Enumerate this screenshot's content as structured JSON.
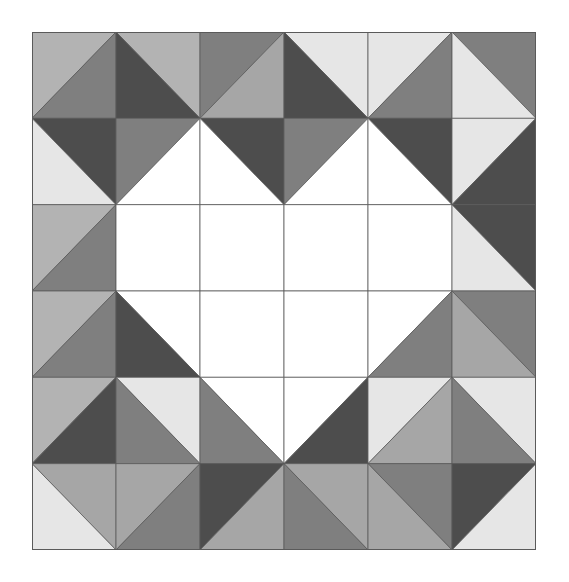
{
  "title": "Heart quilt block pattern",
  "grid": {
    "rows": 6,
    "cols": 6,
    "cell_w": 84,
    "cell_h": 86.33
  },
  "palette": {
    "W": "#ffffff",
    "VL": "#e6e6e6",
    "L": "#b3b3b3",
    "LM": "#a6a6a6",
    "M": "#7f7f7f",
    "D": "#4d4d4d",
    "line": "#5a5a5a"
  },
  "cells": [
    [
      {
        "diag": "/",
        "a": "L",
        "b": "M"
      },
      {
        "diag": "\\",
        "a": "L",
        "b": "D"
      },
      {
        "diag": "/",
        "a": "M",
        "b": "LM"
      },
      {
        "diag": "\\",
        "a": "VL",
        "b": "D"
      },
      {
        "diag": "/",
        "a": "VL",
        "b": "M"
      },
      {
        "diag": "\\",
        "a": "M",
        "b": "VL"
      }
    ],
    [
      {
        "diag": "\\",
        "a": "D",
        "b": "VL"
      },
      {
        "diag": "/",
        "a": "M",
        "b": "W"
      },
      {
        "diag": "\\",
        "a": "D",
        "b": "W"
      },
      {
        "diag": "/",
        "a": "M",
        "b": "W"
      },
      {
        "diag": "\\",
        "a": "D",
        "b": "W"
      },
      {
        "diag": "/",
        "a": "VL",
        "b": "D"
      }
    ],
    [
      {
        "diag": "/",
        "a": "L",
        "b": "M"
      },
      {
        "diag": "none",
        "a": "W",
        "b": "W"
      },
      {
        "diag": "none",
        "a": "W",
        "b": "W"
      },
      {
        "diag": "none",
        "a": "W",
        "b": "W"
      },
      {
        "diag": "none",
        "a": "W",
        "b": "W"
      },
      {
        "diag": "\\",
        "a": "D",
        "b": "VL"
      }
    ],
    [
      {
        "diag": "/",
        "a": "L",
        "b": "M"
      },
      {
        "diag": "\\",
        "a": "W",
        "b": "D"
      },
      {
        "diag": "none",
        "a": "W",
        "b": "W"
      },
      {
        "diag": "none",
        "a": "W",
        "b": "W"
      },
      {
        "diag": "/",
        "a": "W",
        "b": "M"
      },
      {
        "diag": "\\",
        "a": "M",
        "b": "LM"
      }
    ],
    [
      {
        "diag": "/",
        "a": "L",
        "b": "D"
      },
      {
        "diag": "\\",
        "a": "VL",
        "b": "M"
      },
      {
        "diag": "\\",
        "a": "W",
        "b": "M"
      },
      {
        "diag": "/",
        "a": "W",
        "b": "D"
      },
      {
        "diag": "/",
        "a": "VL",
        "b": "LM"
      },
      {
        "diag": "\\",
        "a": "VL",
        "b": "M"
      }
    ],
    [
      {
        "diag": "\\",
        "a": "LM",
        "b": "VL"
      },
      {
        "diag": "/",
        "a": "LM",
        "b": "M"
      },
      {
        "diag": "/",
        "a": "D",
        "b": "LM"
      },
      {
        "diag": "\\",
        "a": "LM",
        "b": "M"
      },
      {
        "diag": "\\",
        "a": "M",
        "b": "LM"
      },
      {
        "diag": "/",
        "a": "D",
        "b": "VL"
      }
    ]
  ]
}
